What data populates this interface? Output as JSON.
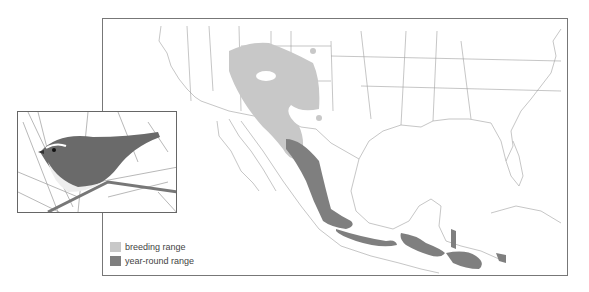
{
  "legend": {
    "items": [
      {
        "label": "breeding range",
        "color": "#c8c8c8"
      },
      {
        "label": "year-round range",
        "color": "#7f7f7f"
      }
    ]
  },
  "map": {
    "region": "Southwestern United States, Mexico and Central America",
    "border_color": "#777777",
    "land_line_color": "#999999"
  },
  "inset": {
    "subject": "bird illustration perched on pine branch"
  }
}
